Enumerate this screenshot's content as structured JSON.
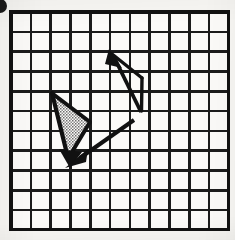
{
  "figure": {
    "background_color": "#f7f6f3",
    "ink_color": "#111111",
    "shade_fill_color": "#9a9a9a"
  },
  "corner_mark": {
    "name": "page-edge-blot",
    "shape": "half-disc",
    "color": "#1a1a1a",
    "cx": 0,
    "cy": 6,
    "r": 7
  },
  "grid": {
    "columns": 11,
    "rows": 11,
    "origin_x": 11,
    "origin_y": 12,
    "cell_size": 19.8,
    "line_color": "#1b1b1b",
    "inner_line_width": 2.6,
    "border_line_width": 3.2,
    "cell_fill": "#fbfaf8"
  },
  "vectors": [
    {
      "id": "v1",
      "name": "upper-right-vector",
      "label": "",
      "tail_x": 143,
      "tail_y": 112,
      "tip_x": 110,
      "tip_y": 51,
      "shaft_width": 3.6,
      "head_length": 16,
      "head_half_width": 7.5,
      "direction": "up-left",
      "grid_tail_cell": [
        6.7,
        5.05
      ],
      "grid_tip_cell": [
        5.0,
        1.97
      ]
    },
    {
      "id": "v2",
      "name": "shaded-triangle-vector",
      "label": "",
      "tail_x": 52,
      "tail_y": 93,
      "tip_x": 70,
      "tip_y": 164,
      "shaft_width": 4.0,
      "head_length": 17,
      "head_half_width": 8.0,
      "direction": "down-right-steep",
      "grid_tail_cell": [
        2.07,
        4.09
      ],
      "grid_tip_cell": [
        2.98,
        7.68
      ]
    },
    {
      "id": "v3",
      "name": "diagonal-vector",
      "label": "",
      "tail_x": 133,
      "tail_y": 121,
      "tip_x": 68,
      "tip_y": 166,
      "shaft_width": 3.8,
      "head_length": 19,
      "head_half_width": 8.0,
      "direction": "down-left",
      "grid_tail_cell": [
        6.16,
        5.51
      ],
      "grid_tip_cell": [
        2.88,
        7.78
      ]
    }
  ],
  "shaded_region": {
    "name": "stippled-triangle",
    "fill_pattern": "stipple-dots",
    "vertices": [
      {
        "x": 54,
        "y": 95
      },
      {
        "x": 89,
        "y": 121
      },
      {
        "x": 69,
        "y": 155
      }
    ]
  },
  "open_region": {
    "name": "upper-open-triangle",
    "fill_pattern": "none",
    "vertices": [
      {
        "x": 112,
        "y": 53
      },
      {
        "x": 142,
        "y": 76
      },
      {
        "x": 141,
        "y": 110
      }
    ]
  }
}
